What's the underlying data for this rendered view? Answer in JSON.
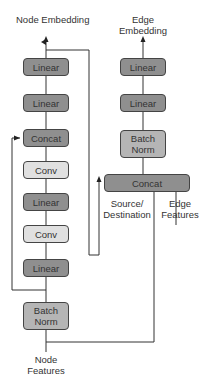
{
  "diagram": {
    "node_branch": {
      "output_label": "Node Embedding",
      "input_label": "Node Features",
      "blocks": [
        {
          "label": "Linear",
          "shade": "dark"
        },
        {
          "label": "Linear",
          "shade": "dark"
        },
        {
          "label": "Concat",
          "shade": "dark"
        },
        {
          "label": "Conv",
          "shade": "light"
        },
        {
          "label": "Linear",
          "shade": "dark"
        },
        {
          "label": "Conv",
          "shade": "light"
        },
        {
          "label": "Linear",
          "shade": "dark"
        },
        {
          "label": "Batch Norm",
          "shade": "mid"
        }
      ]
    },
    "edge_branch": {
      "output_label": "Edge Embedding",
      "blocks": [
        {
          "label": "Linear",
          "shade": "dark"
        },
        {
          "label": "Linear",
          "shade": "dark"
        },
        {
          "label": "Batch Norm",
          "shade": "mid"
        },
        {
          "label": "Concat",
          "shade": "dark"
        }
      ],
      "inputs": [
        {
          "label": "Source/ Destination"
        },
        {
          "label": "Edge Features"
        }
      ]
    },
    "colors": {
      "dark_block": "#8f8f8f",
      "mid_block": "#b5b5b5",
      "light_block": "#e0e0e0",
      "line": "#333333"
    }
  }
}
